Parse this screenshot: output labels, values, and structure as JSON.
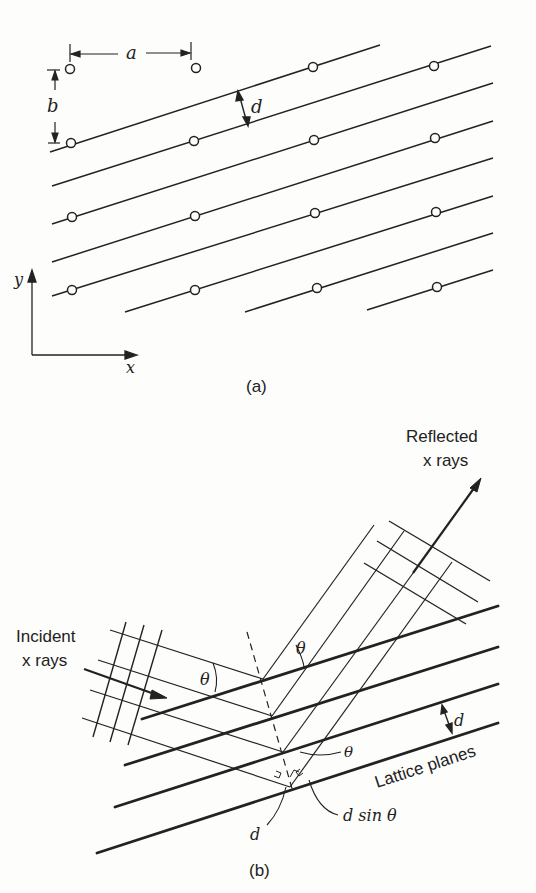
{
  "panel_a": {
    "caption": "(a)",
    "labels": {
      "a": "a",
      "b": "b",
      "d": "d",
      "x_axis": "x",
      "y_axis": "y"
    },
    "lattice_rows": 4,
    "lattice_columns": 4
  },
  "panel_b": {
    "caption": "(b)",
    "incident_label_line1": "Incident",
    "incident_label_line2": "x rays",
    "reflected_label_line1": "Reflected",
    "reflected_label_line2": "x rays",
    "lattice_planes_label": "Lattice planes",
    "theta": "θ",
    "d": "d",
    "d_sin_theta": "d sin θ"
  },
  "colors": {
    "ink": "#222222",
    "background": "#fdfdfb"
  }
}
